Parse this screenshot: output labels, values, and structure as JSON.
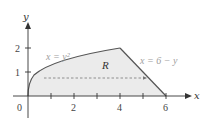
{
  "diagram": {
    "axes": {
      "x_label": "x",
      "y_label": "y",
      "origin_label": "0",
      "x_ticks": [
        1,
        2,
        3,
        4,
        5,
        6
      ],
      "x_tick_labels": [
        "2",
        "4",
        "6"
      ],
      "y_ticks": [
        1,
        2
      ],
      "y_tick_labels": [
        "1",
        "2"
      ]
    },
    "curves": {
      "left": "x = y²",
      "right": "x = 6 − y"
    },
    "region_label": "R",
    "vertices": [
      [
        0,
        0
      ],
      [
        4,
        2
      ],
      [
        6,
        0
      ]
    ],
    "dashed_segment_y": 0.75,
    "colors": {
      "fill": "#ebebeb",
      "boundary": "#555555",
      "axis": "#333333",
      "dashed": "#777777",
      "curve_label": "#a0a0a0"
    }
  }
}
